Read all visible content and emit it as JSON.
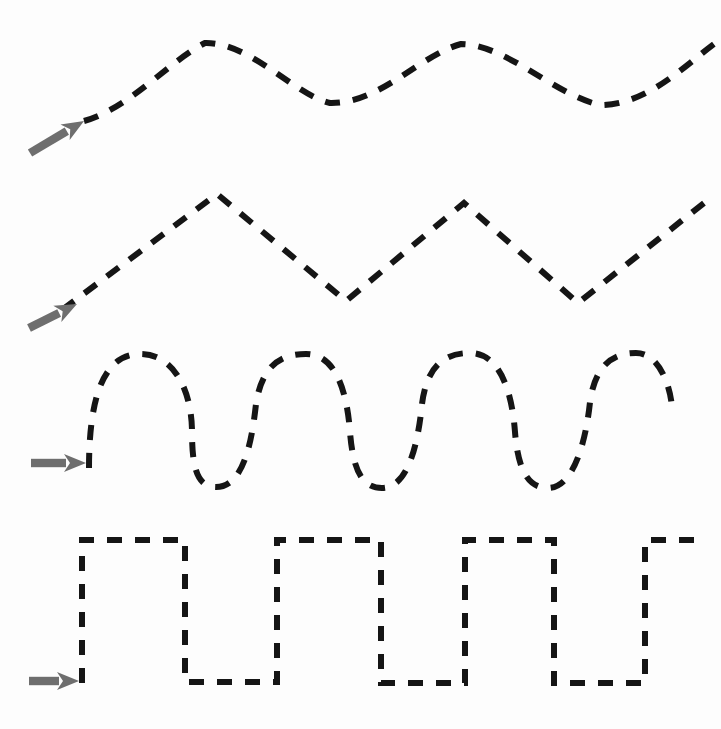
{
  "canvas": {
    "width": 721,
    "height": 729,
    "background_color": "#fdfdfd",
    "title": "Dashed waveform comparison diagram"
  },
  "style": {
    "stroke_color": "#151515",
    "arrow_color": "#6e6e6e",
    "stroke_width": 6,
    "dash_pattern": "15 13"
  },
  "chart_data": {
    "type": "line",
    "xlabel": "",
    "ylabel": "",
    "grid": false,
    "legend": "none",
    "xlim": [
      0,
      721
    ],
    "ylim": [
      0,
      729
    ],
    "series": [
      {
        "name": "sine-wave-low-frequency",
        "waveform": "sine",
        "cycles": 2,
        "amplitude": 31,
        "baseline_y": 73,
        "peak_y": 42,
        "trough_y": 104,
        "start_x": 84,
        "end_x": 721,
        "path": "M 84,121 C 130,108 168,62 205,43 C 250,42 295,95 330,103 C 380,104 420,55 461,44 C 505,44 555,95 600,105 C 650,105 690,60 721,39"
      },
      {
        "name": "triangle-wave",
        "waveform": "triangle",
        "cycles": 2.5,
        "amplitude": 54,
        "baseline_y": 249,
        "peak_y": 194,
        "trough_y": 303,
        "start_x": 62,
        "end_x": 704,
        "path": "M 62,310 L 217,194 L 346,301 L 464,203 L 578,303 L 704,203"
      },
      {
        "name": "sine-wave-high-frequency",
        "waveform": "sine",
        "cycles": 4,
        "amplitude": 66,
        "baseline_y": 420,
        "peak_y": 353,
        "trough_y": 487,
        "start_x": 89,
        "end_x": 672,
        "path": "M 89,468 C 89,392 106,354 140,354 C 176,354 192,394 192,432 C 192,470 198,487 216,487 C 244,487 252,440 256,404 C 262,366 280,354 306,354 C 336,354 347,392 350,432 C 353,470 362,488 382,488 C 408,488 418,444 422,404 C 427,366 444,353 470,353 C 500,353 512,392 515,432 C 518,470 528,488 548,488 C 574,488 586,440 590,402 C 595,366 612,353 636,353 C 662,353 672,394 672,410"
      },
      {
        "name": "square-wave",
        "waveform": "square",
        "cycles": 3.5,
        "amplitude": 72,
        "baseline_y": 610,
        "high_y": 540,
        "low_y": 682,
        "start_x": 82,
        "end_x": 703,
        "path": "M 82,683 L 82,540 L 185,540 L 185,682 L 277,682 L 277,540 L 381,540 L 381,683 L 465,683 L 465,540 L 554,540 L 554,683 L 645,683 L 645,540 L 703,540"
      }
    ],
    "markers": [
      {
        "name": "arrow-marker-1",
        "for_series": "sine-wave-low-frequency",
        "x1": 30,
        "y1": 153,
        "x2": 84,
        "y2": 121,
        "direction": "up-right",
        "angle_deg": -30
      },
      {
        "name": "arrow-marker-2",
        "for_series": "triangle-wave",
        "x1": 29,
        "y1": 328,
        "x2": 77,
        "y2": 304,
        "direction": "up-right",
        "angle_deg": -26
      },
      {
        "name": "arrow-marker-3",
        "for_series": "sine-wave-high-frequency",
        "x1": 31,
        "y1": 463,
        "x2": 86,
        "y2": 463,
        "direction": "right",
        "angle_deg": 0
      },
      {
        "name": "arrow-marker-4",
        "for_series": "square-wave",
        "x1": 29,
        "y1": 681,
        "x2": 79,
        "y2": 681,
        "direction": "right",
        "angle_deg": 0
      }
    ]
  }
}
